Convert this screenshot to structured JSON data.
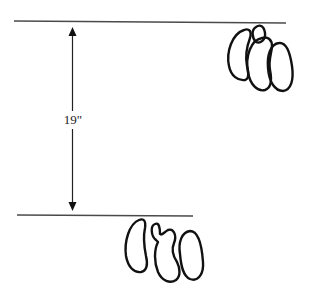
{
  "diagram": {
    "measurement": {
      "label": "19\"",
      "description": "distance between front hoof prints and hind hoof prints"
    },
    "top_group": {
      "name": "hoof-print-cluster-front",
      "count": 4
    },
    "bottom_group": {
      "name": "hoof-print-cluster-hind",
      "count": 3
    },
    "colors": {
      "line": "#4a4a4a",
      "ink": "#111111",
      "background": "#ffffff"
    }
  }
}
